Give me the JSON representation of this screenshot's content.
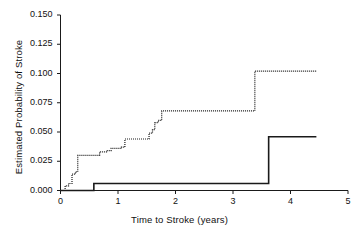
{
  "chart_data": {
    "type": "line",
    "subtype": "step",
    "title": "",
    "xlabel": "Time to Stroke (years)",
    "ylabel": "Estimated Probability of Stroke",
    "xlim": [
      0,
      5
    ],
    "ylim": [
      0.0,
      0.15
    ],
    "xticks": [
      0,
      1,
      2,
      3,
      4,
      5
    ],
    "xtick_labels": [
      "0",
      "1",
      "2",
      "3",
      "4",
      "5"
    ],
    "yticks": [
      0.0,
      0.025,
      0.05,
      0.075,
      0.1,
      0.125,
      0.15
    ],
    "ytick_labels": [
      "0.000",
      "0.025",
      "0.050",
      "0.075",
      "0.100",
      "0.125",
      "0.150"
    ],
    "grid": false,
    "legend": null,
    "legend_position": "none",
    "series": [
      {
        "name": "dotted-upper-curve",
        "style": "dotted",
        "color": "#1a1a1a",
        "x": [
          0.0,
          0.05,
          0.08,
          0.14,
          0.2,
          0.26,
          0.3,
          0.62,
          0.68,
          0.8,
          0.88,
          1.06,
          1.12,
          1.48,
          1.54,
          1.6,
          1.64,
          1.7,
          1.76,
          3.32,
          3.38,
          4.45
        ],
        "y": [
          0.0,
          0.0,
          0.004,
          0.006,
          0.014,
          0.016,
          0.03,
          0.03,
          0.033,
          0.034,
          0.036,
          0.037,
          0.044,
          0.044,
          0.049,
          0.052,
          0.058,
          0.06,
          0.068,
          0.068,
          0.102,
          0.102
        ]
      },
      {
        "name": "solid-lower-curve",
        "style": "solid",
        "color": "#1a1a1a",
        "x": [
          0.0,
          0.55,
          0.58,
          3.58,
          3.62,
          4.45
        ],
        "y": [
          0.0,
          0.0,
          0.006,
          0.006,
          0.046,
          0.046
        ]
      }
    ],
    "annotations": []
  },
  "axes": {
    "x_axis_name": "x-axis",
    "y_axis_name": "y-axis"
  }
}
